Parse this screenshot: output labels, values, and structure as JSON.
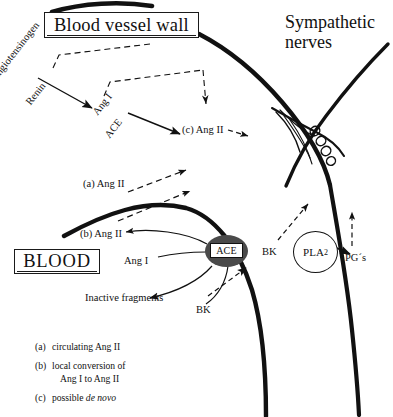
{
  "figure": {
    "title_boxes": {
      "vessel_wall": "Blood vessel wall",
      "blood": "BLOOD"
    },
    "labels": {
      "sympathetic_nerves_line1": "Sympathetic",
      "sympathetic_nerves_line2": "nerves",
      "angiotensinogen": "Angiotensinogen",
      "renin": "Renin",
      "ang_i_wall": "Ang I",
      "ace_pathway": "ACE",
      "c_ang_ii": "(c) Ang II",
      "a_ang_ii": "(a) Ang II",
      "b_ang_ii": "(b) Ang II",
      "ang_i_blood": "Ang I",
      "inactive_fragments": "Inactive fragments",
      "bk_blood": "BK",
      "bk_wall": "BK",
      "pgs": "PG´s",
      "ace_enzyme": "ACE",
      "pla2": "PLA",
      "pla2_sub": "2"
    },
    "legend": [
      {
        "tag": "(a)",
        "text": "circulating Ang II",
        "line2": ""
      },
      {
        "tag": "(b)",
        "text": "local conversion of",
        "line2": "Ang I to Ang II"
      },
      {
        "tag": "(c)",
        "text_plain": "possible ",
        "text_italic": "de novo",
        "line2": ""
      }
    ],
    "colors": {
      "ink": "#111111",
      "vessel_wall_stroke": "#111111",
      "ace_fill": "#4a4a4a",
      "background": "#ffffff"
    }
  }
}
